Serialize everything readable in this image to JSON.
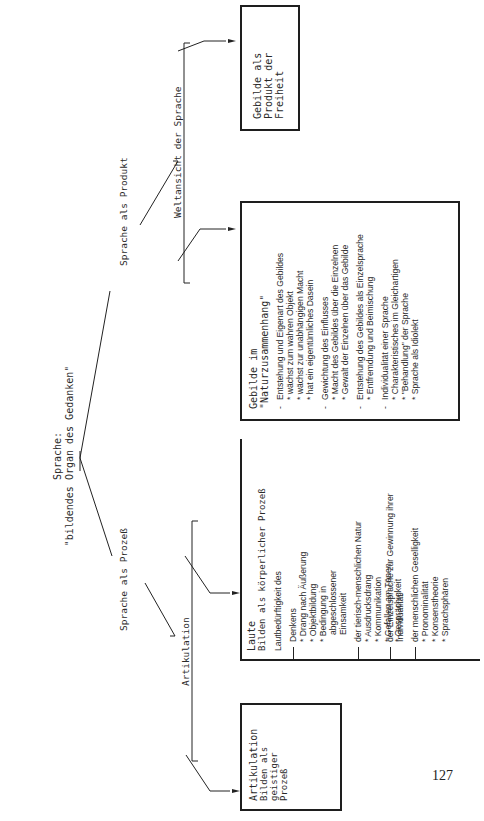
{
  "root": {
    "line1": "Sprache:",
    "line2": "\"bildendes Organ des Gedanken\""
  },
  "branches": {
    "process": "Sprache als Prozeß",
    "product": "Sprache als Produkt",
    "articulation": "Artikulation",
    "worldview": "Weltansicht der Sprache"
  },
  "box_artikulation": {
    "head": "Artikulation",
    "sub": [
      "Bilden als geistiger",
      "Prozeß"
    ]
  },
  "box_laute": {
    "head": "Laute",
    "sub": "Bilden als körperlicher Prozeß",
    "intro": "Lautbedürftigkeit des",
    "sections": [
      {
        "heading": "Denkens",
        "items": [
          "Drang nach Äußerung",
          "Objektbildung",
          "Bedingung in abgeschlossener Einsamkeit"
        ]
      },
      {
        "heading": "der tierisch-menschlichen Natur",
        "items": [
          "Ausdrucksdrang",
          "Kommunikation",
          "Gefallen am Tönen",
          "Gesprächigkeit"
        ]
      },
      {
        "heading": "der Einzelsprache zur Gewinnung ihrer Individualität",
        "items": []
      },
      {
        "heading": "der menschlichen Geselligkeit",
        "items": [
          "Pronominalität",
          "Konsenstheorie",
          "Sprachsphären"
        ]
      }
    ]
  },
  "box_natur": {
    "head": "Gebilde im",
    "sub": "\"Naturzusammenhang\"",
    "sections": [
      {
        "heading": "Entstehung und Eigenart des Gebildes",
        "items": [
          "wächst zum wahren Objekt",
          "wächst zur unabhängigen Macht",
          "hat ein eigentümliches Dasein"
        ]
      },
      {
        "heading": "Gewichtung des Einflusses",
        "items": [
          "Macht des Gebildes über die Einzelnen",
          "Gewalt der Einzelnen über das Gebilde"
        ]
      },
      {
        "heading": "Entstehung des Gebildes als Einzelsprache",
        "items": [
          "Entfremdung und Beimischung"
        ]
      },
      {
        "heading": "Individualität einer Sprache",
        "items": [
          "Charakteristisches im Gleichartigen",
          "\"Behandlung\" der Sprache",
          "Sprache als Idiolekt"
        ]
      }
    ]
  },
  "box_freiheit": {
    "head": "Gebilde als",
    "sub": "Produkt der Freiheit"
  },
  "page_number": "127"
}
